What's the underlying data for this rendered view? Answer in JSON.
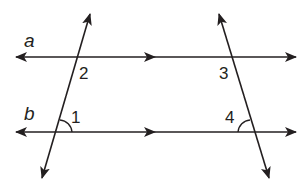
{
  "diagram": {
    "type": "parallel-lines-cut-by-two-transversals",
    "stroke_color": "#231f20",
    "background": "#ffffff",
    "lines": [
      {
        "id": "a",
        "label": "a",
        "kind": "parallel",
        "parallel_marker": "single-arrow"
      },
      {
        "id": "b",
        "label": "b",
        "kind": "parallel",
        "parallel_marker": "single-arrow"
      }
    ],
    "transversals": [
      {
        "id": "left",
        "direction": "up-right"
      },
      {
        "id": "right",
        "direction": "up-left"
      }
    ],
    "angles": [
      {
        "label": "1",
        "marked_with_arc": true
      },
      {
        "label": "2",
        "marked_with_arc": false
      },
      {
        "label": "3",
        "marked_with_arc": false
      },
      {
        "label": "4",
        "marked_with_arc": true
      }
    ]
  }
}
